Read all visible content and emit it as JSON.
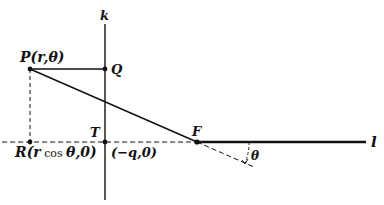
{
  "diagram": {
    "axis_k_label": "k",
    "axis_l_label": "l",
    "points": {
      "P": {
        "label": "P(r,θ)"
      },
      "Q": {
        "label": "Q"
      },
      "T": {
        "label": "T"
      },
      "F": {
        "label": "F"
      },
      "R": {
        "label_main": "R(r",
        "label_cos": "cos",
        "label_tail": "θ,0)"
      },
      "T_coord": {
        "label": "(−q,0)"
      }
    },
    "angle_label": "θ",
    "colors": {
      "ink": "#111111",
      "background": "#ffffff"
    }
  }
}
